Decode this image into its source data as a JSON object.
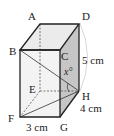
{
  "figure": {
    "type": "rectangular prism (cuboid)",
    "vertices": {
      "A": "A",
      "B": "B",
      "C": "C",
      "D": "D",
      "E": "E",
      "F": "F",
      "G": "G",
      "H": "H"
    },
    "dimensions": {
      "height": "5 cm",
      "depth": "4 cm",
      "width": "3 cm"
    },
    "angle_label": "x°",
    "colors": {
      "edge": "#222222",
      "front_face": "#f2f2f2",
      "top_face": "#ebebeb",
      "side_face": "#c6c6c6",
      "hidden": "#555555",
      "bracket": "#cccccc"
    }
  }
}
